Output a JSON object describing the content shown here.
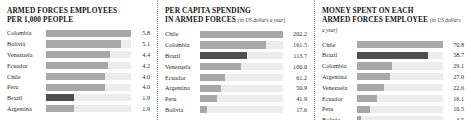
{
  "chart_data": [
    {
      "type": "bar",
      "title": "ARMED FORCES EMPLOYEES PER 1,000 PEOPLE",
      "title_line1": "ARMED FORCES EMPLOYEES",
      "title_line2": "PER 1,000 PEOPLE",
      "unit_note": "",
      "orientation": "horizontal",
      "xlabel": "",
      "ylabel": "",
      "grid": false,
      "legend": "none",
      "xlim": [
        0,
        5.8
      ],
      "highlight": "Brazil",
      "categories": [
        "Colombia",
        "Bolivia",
        "Venezuela",
        "Ecuador",
        "Chile",
        "Peru",
        "Brazil",
        "Argentina"
      ],
      "values": [
        5.8,
        5.1,
        4.4,
        4.2,
        4.0,
        4.0,
        1.9,
        1.9
      ],
      "value_labels": [
        "5.8",
        "5.1",
        "4.4",
        "4.2",
        "4.0",
        "4.0",
        "1.9",
        "1.9"
      ]
    },
    {
      "type": "bar",
      "title": "PER CAPITA SPENDING IN ARMED FORCES",
      "title_line1": "PER CAPITA SPENDING",
      "title_line2": "IN ARMED FORCES",
      "unit_note": "(in US dollars a year)",
      "orientation": "horizontal",
      "xlabel": "",
      "ylabel": "",
      "grid": false,
      "legend": "none",
      "xlim": [
        0,
        202.2
      ],
      "highlight": "Brazil",
      "categories": [
        "Chile",
        "Colombia",
        "Brazil",
        "Venezuela",
        "Ecuador",
        "Argentina",
        "Peru",
        "Bolivia"
      ],
      "values": [
        202.2,
        161.5,
        113.7,
        100.0,
        61.2,
        50.9,
        41.9,
        17.6
      ],
      "value_labels": [
        "202.2",
        "161.5",
        "113.7",
        "100.0",
        "61.2",
        "50.9",
        "41.9",
        "17.6"
      ]
    },
    {
      "type": "bar",
      "title": "MONEY SPENT ON EACH ARMED FORCES EMPLOYEE",
      "title_line1": "MONEY SPENT ON EACH",
      "title_line2": "ARMED FORCES EMPLOYEE",
      "unit_note": "(in US dollars a year)",
      "orientation": "horizontal",
      "xlabel": "",
      "ylabel": "",
      "grid": false,
      "legend": "none",
      "xlim": [
        0,
        70.8
      ],
      "highlight": "Brazil",
      "categories": [
        "Chile",
        "Brazil",
        "Colombia",
        "Argentina",
        "Venezuela",
        "Ecuador",
        "Peru",
        "Bolivia"
      ],
      "values": [
        70.8,
        58.7,
        29.1,
        27.0,
        22.6,
        16.1,
        10.5,
        3.5
      ],
      "value_labels": [
        "70.8",
        "58.7",
        "29.1",
        "27.0",
        "22.6",
        "16.1",
        "10.5",
        "3.5"
      ]
    }
  ],
  "colors": {
    "bar": "#a8a8a8",
    "bar_highlight": "#4f4f4f",
    "track": "#ececec",
    "text": "#2b2b2b",
    "title": "#141414",
    "divider": "#9a9a9a",
    "background": "#ffffff"
  }
}
